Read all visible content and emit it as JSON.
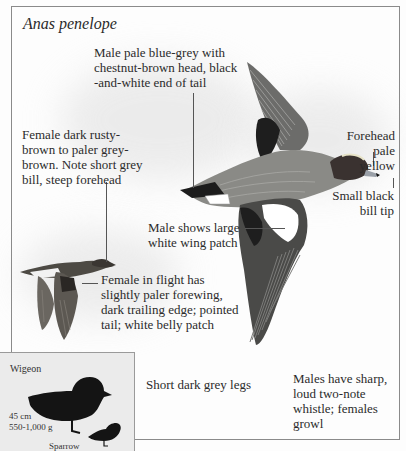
{
  "species": {
    "scientific_name": "Anas penelope"
  },
  "annotations": {
    "male_plumage": "Male pale blue-grey with\nchestnut-brown head, black\n-and-white end of tail",
    "female_plumage": "Female dark rusty-\nbrown to paler grey-\nbrown. Note short grey\nbill, steep forehead",
    "forehead": "Forehead\npale yellow",
    "bill_tip": "Small black\nbill tip",
    "male_wing_patch": "Male shows large\nwhite wing patch",
    "female_flight": "Female in flight has\nslightly paler forewing,\ndark trailing edge; pointed\ntail; white belly patch",
    "legs": "Short dark grey legs",
    "call": "Males have sharp,\nloud two-note\nwhistle; females\ngrowl"
  },
  "size_comparison": {
    "species_label": "Wigeon",
    "length": "45 cm",
    "weight": "550-1,000 g",
    "reference_label": "Sparrow"
  },
  "colors": {
    "male_body": "#8a8a86",
    "male_head": "#3a3230",
    "wing_dark": "#4a4a48",
    "wing_patch": "#ffffff",
    "female_body": "#4d4a44",
    "silhouette": "#141414",
    "inset_bg": "#ebebeb",
    "frame": "#8a8a8a"
  }
}
